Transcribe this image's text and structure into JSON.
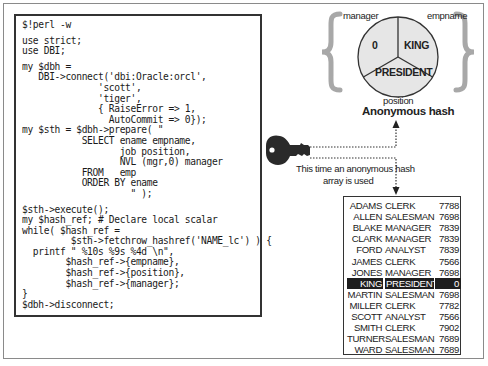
{
  "code": {
    "lines": [
      "$!perl -w",
      "",
      "use strict;",
      "use DBI;",
      "",
      "my $dbh =",
      "   DBI->connect('dbi:Oracle:orcl',",
      "              'scott',",
      "              'tiger',",
      "              { RaiseError => 1,",
      "                AutoCommit => 0});",
      "my $sth = $dbh->prepare( \"",
      "           SELECT ename empname,",
      "                  job position,",
      "                  NVL (mgr,0) manager",
      "           FROM   emp",
      "           ORDER BY ename",
      "                    \" );",
      "",
      "$sth->execute();",
      "my $hash_ref; # Declare local scalar",
      "while( $hash_ref =",
      "         $sth->fetchrow_hashref('NAME_lc') ) {",
      "  printf \" %10s %9s %4d \\n\",",
      "        $hash_ref->{empname},",
      "        $hash_ref->{position},",
      "        $hash_ref->{manager};",
      "}",
      "$dbh->disconnect;"
    ]
  },
  "hash_diagram": {
    "labels": {
      "manager": "manager",
      "empname": "empname",
      "position": "position"
    },
    "values": {
      "manager": "0",
      "empname": "KING",
      "position": "PRESIDENT"
    },
    "title": "Anonymous hash"
  },
  "annotation": {
    "line1": "This time an anonymous hash",
    "line2": "array is used"
  },
  "table": {
    "columns": [
      "ename",
      "job",
      "mgr"
    ],
    "rows": [
      [
        "ADAMS",
        "CLERK",
        "7788"
      ],
      [
        "ALLEN",
        "SALESMAN",
        "7698"
      ],
      [
        "BLAKE",
        "MANAGER",
        "7839"
      ],
      [
        "CLARK",
        "MANAGER",
        "7839"
      ],
      [
        "FORD",
        "ANALYST",
        "7839"
      ],
      [
        "JAMES",
        "CLERK",
        "7566"
      ],
      [
        "JONES",
        "MANAGER",
        "7698"
      ],
      [
        "KING",
        "PRESIDENT",
        "0"
      ],
      [
        "MARTIN",
        "SALESMAN",
        "7698"
      ],
      [
        "MILLER",
        "CLERK",
        "7782"
      ],
      [
        "SCOTT",
        "ANALYST",
        "7566"
      ],
      [
        "SMITH",
        "CLERK",
        "7902"
      ],
      [
        "TURNER",
        "SALESMAN",
        "7689"
      ],
      [
        "WARD",
        "SALESMAN",
        "7689"
      ]
    ],
    "highlighted_row": 7
  },
  "colors": {
    "frame": "#8a8a8a",
    "box_border": "#333333",
    "hash_fill": "#e6e6e6",
    "brace": "#a8a8a8",
    "highlight_bg": "#1e1e1e",
    "key": "#2a2a2a"
  }
}
